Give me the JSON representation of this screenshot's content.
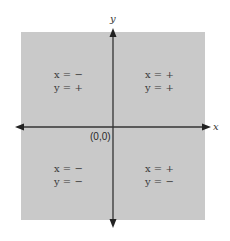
{
  "diagram": {
    "colors": {
      "plane_fill": "#c9c9c9",
      "axis": "#333333",
      "text": "#3a3a3a"
    },
    "axes": {
      "x_label": "x",
      "y_label": "y",
      "origin_label": "(0,0)"
    },
    "quadrants": [
      {
        "id": "top-left",
        "x_line": "x = −",
        "y_line": "y = +"
      },
      {
        "id": "top-right",
        "x_line": "x = +",
        "y_line": "y = +"
      },
      {
        "id": "bottom-left",
        "x_line": "x = −",
        "y_line": "y = −"
      },
      {
        "id": "bottom-right",
        "x_line": "x = +",
        "y_line": "y = −"
      }
    ]
  }
}
